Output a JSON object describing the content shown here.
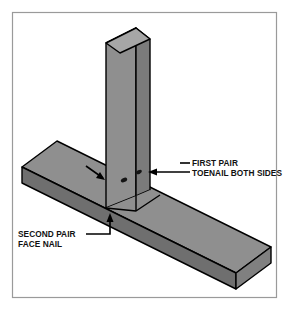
{
  "figure": {
    "background_color": "#ffffff",
    "border_color": "#9a9a9a",
    "line_color": "#000000",
    "wood_face_color": "#8f8f8f",
    "wood_dark_color": "#787878",
    "wood_light_color": "#a2a2a2",
    "nail_mark_color": "#141414"
  },
  "annotations": {
    "first_pair": {
      "line1": "FIRST PAIR",
      "line2": "TOENAIL BOTH SIDES"
    },
    "second_pair": {
      "line1": "SECOND PAIR",
      "line2": "FACE NAIL"
    }
  },
  "parts": {
    "post_name": "vertical post",
    "board_name": "horizontal board",
    "nail_marks_count": 2
  }
}
